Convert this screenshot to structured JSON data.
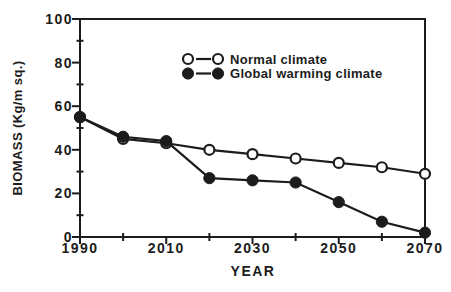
{
  "figure": {
    "background": "#ffffff",
    "ink_color": "#1c1c1c"
  },
  "chart_data": {
    "type": "line",
    "title": "",
    "xlabel": "YEAR",
    "ylabel": "BIOMASS (Kg/m sq.)",
    "x": [
      1990,
      2000,
      2010,
      2020,
      2030,
      2040,
      2050,
      2060,
      2070
    ],
    "series": [
      {
        "name": "Normal climate",
        "marker": "open-circle",
        "color": "#1c1c1c",
        "values": [
          55,
          45,
          43,
          40,
          38,
          36,
          34,
          32,
          29
        ]
      },
      {
        "name": "Global warming climate",
        "marker": "filled-circle",
        "color": "#1c1c1c",
        "values": [
          55,
          46,
          44,
          27,
          26,
          25,
          16,
          7,
          2
        ]
      }
    ],
    "xlim": [
      1990,
      2070
    ],
    "ylim": [
      0,
      100
    ],
    "x_major_ticks": [
      1990,
      2010,
      2030,
      2050,
      2070
    ],
    "x_minor_ticks": [
      2000,
      2020,
      2040,
      2060
    ],
    "y_major_ticks": [
      0,
      20,
      40,
      60,
      80,
      100
    ],
    "y_minor_ticks": [
      10,
      30,
      50,
      70,
      90
    ],
    "grid": false,
    "legend": {
      "position": "upper-center"
    }
  }
}
